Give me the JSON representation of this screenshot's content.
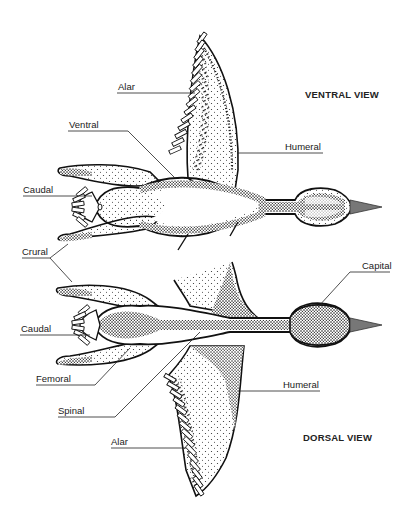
{
  "diagram": {
    "views": [
      {
        "title": "VENTRAL VIEW",
        "labels": [
          {
            "text": "Alar"
          },
          {
            "text": "Ventral"
          },
          {
            "text": "Humeral"
          },
          {
            "text": "Caudal"
          },
          {
            "text": "Crural"
          }
        ]
      },
      {
        "title": "DORSAL VIEW",
        "labels": [
          {
            "text": "Capital"
          },
          {
            "text": "Caudal"
          },
          {
            "text": "Femoral"
          },
          {
            "text": "Spinal"
          },
          {
            "text": "Humeral"
          },
          {
            "text": "Alar"
          }
        ]
      }
    ],
    "colors": {
      "outline": "#111111",
      "stipple": "#2a2a2a",
      "beak": "#777777",
      "background": "#ffffff"
    }
  }
}
